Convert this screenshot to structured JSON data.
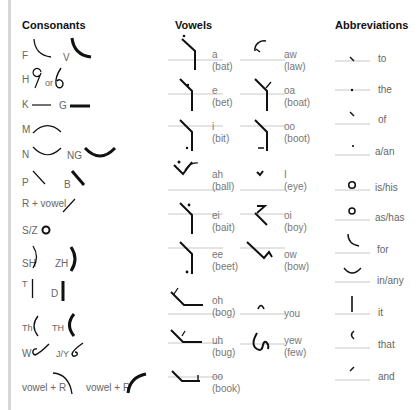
{
  "columns": {
    "consonants": {
      "title": "Consonants",
      "items": [
        {
          "label": "F"
        },
        {
          "label": "V"
        },
        {
          "label": "H"
        },
        {
          "label": "or"
        },
        {
          "label": "K"
        },
        {
          "label": "G"
        },
        {
          "label": "M"
        },
        {
          "label": "N"
        },
        {
          "label": "NG"
        },
        {
          "label": "P"
        },
        {
          "label": "B"
        },
        {
          "label": "R + vowel"
        },
        {
          "label": "S/Z"
        },
        {
          "label": "SH"
        },
        {
          "label": "ZH"
        },
        {
          "label": "T"
        },
        {
          "label": "D"
        },
        {
          "label": "Th"
        },
        {
          "label": "TH"
        },
        {
          "label": "W"
        },
        {
          "label": "J/Y"
        },
        {
          "label": "vowel + R"
        },
        {
          "label": "vowel + R"
        }
      ]
    },
    "vowels": {
      "title": "Vowels",
      "items": [
        {
          "sound": "a",
          "example": "(bat)"
        },
        {
          "sound": "aw",
          "example": "(law)"
        },
        {
          "sound": "e",
          "example": "(bet)"
        },
        {
          "sound": "oa",
          "example": "(boat)"
        },
        {
          "sound": "i",
          "example": "(bit)"
        },
        {
          "sound": "oo",
          "example": "(boot)"
        },
        {
          "sound": "ah",
          "example": "(ball)"
        },
        {
          "sound": "I",
          "example": "(eye)"
        },
        {
          "sound": "ei",
          "example": "(bait)"
        },
        {
          "sound": "oi",
          "example": "(boy)"
        },
        {
          "sound": "ee",
          "example": "(beet)"
        },
        {
          "sound": "ow",
          "example": "(bow)"
        },
        {
          "sound": "oh",
          "example": "(bog)"
        },
        {
          "sound": "you",
          "example": ""
        },
        {
          "sound": "uh",
          "example": "(bug)"
        },
        {
          "sound": "yew",
          "example": "(few)"
        },
        {
          "sound": "oo",
          "example": "(book)"
        }
      ]
    },
    "abbreviations": {
      "title": "Abbreviations",
      "items": [
        {
          "word": "to"
        },
        {
          "word": "the"
        },
        {
          "word": "of"
        },
        {
          "word": "a/an"
        },
        {
          "word": "is/his"
        },
        {
          "word": "as/has"
        },
        {
          "word": "for"
        },
        {
          "word": "in/any"
        },
        {
          "word": "it"
        },
        {
          "word": "that"
        },
        {
          "word": "and"
        }
      ]
    }
  },
  "colors": {
    "ink": "#111111",
    "rule": "#c8c8c8",
    "border": "#d6d6d6"
  }
}
